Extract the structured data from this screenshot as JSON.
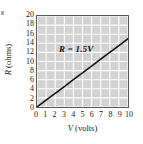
{
  "figure": {
    "width": 143,
    "height": 144,
    "background_color": "#ffffff",
    "plot_background_color": "#d2d2d2",
    "gridline_color": "#ffffff",
    "frame_color": "#5a5a5a",
    "line_color": "#111111",
    "edge_artifact_name": "cropped-figure-label-artifact"
  },
  "chart_data": {
    "type": "line",
    "title": "",
    "xlabel": "V (volts)",
    "xlabel_symbol": "V",
    "xlabel_unit": "(volts)",
    "ylabel": "R (ohms)",
    "ylabel_symbol": "R",
    "ylabel_unit": "(ohms)",
    "xlim": [
      0,
      10
    ],
    "ylim": [
      0,
      20
    ],
    "xticks": [
      0,
      1,
      2,
      3,
      4,
      5,
      6,
      7,
      8,
      9,
      10
    ],
    "xticklabels": [
      "0",
      "1",
      "2",
      "3",
      "4",
      "5",
      "6",
      "7",
      "8",
      "9",
      "10"
    ],
    "yticks": [
      0,
      2,
      4,
      6,
      8,
      10,
      12,
      14,
      16,
      18,
      20
    ],
    "yticklabels": [
      "0",
      "2",
      "4",
      "6",
      "8",
      "10",
      "12",
      "14",
      "16",
      "18",
      "20"
    ],
    "grid": true,
    "grid_axes": "both",
    "legend": false,
    "legend_position": "none",
    "annotations": [
      {
        "text": "R = 1.5V",
        "x": 3.2,
        "y": 11.5,
        "style": "bold-italic"
      }
    ],
    "series": [
      {
        "name": "R = 1.5V",
        "slope": 1.5,
        "intercept": 0,
        "x": [
          0,
          1,
          2,
          3,
          4,
          5,
          6,
          7,
          8,
          9,
          10
        ],
        "values": [
          0,
          1.5,
          3,
          4.5,
          6,
          7.5,
          9,
          10.5,
          12,
          13.5,
          15
        ],
        "line_width": 1.6,
        "color": "#111111"
      }
    ]
  }
}
